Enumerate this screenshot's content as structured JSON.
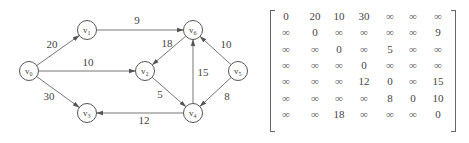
{
  "graph": {
    "nodes": [
      {
        "id": "v0",
        "base": "v",
        "sub": "0",
        "x": 29,
        "y": 71
      },
      {
        "id": "v1",
        "base": "v",
        "sub": "1",
        "x": 87,
        "y": 30
      },
      {
        "id": "v2",
        "base": "v",
        "sub": "2",
        "x": 145,
        "y": 71
      },
      {
        "id": "v3",
        "base": "v",
        "sub": "3",
        "x": 87,
        "y": 113
      },
      {
        "id": "v4",
        "base": "v",
        "sub": "4",
        "x": 193,
        "y": 113
      },
      {
        "id": "v5",
        "base": "v",
        "sub": "5",
        "x": 238,
        "y": 71
      },
      {
        "id": "v6",
        "base": "v",
        "sub": "6",
        "x": 193,
        "y": 30
      }
    ],
    "edges": [
      {
        "from": "v0",
        "to": "v1",
        "weight": "20",
        "lx": 52,
        "ly": 48
      },
      {
        "from": "v0",
        "to": "v2",
        "weight": "10",
        "lx": 88,
        "ly": 66
      },
      {
        "from": "v0",
        "to": "v3",
        "weight": "30",
        "lx": 49,
        "ly": 100
      },
      {
        "from": "v1",
        "to": "v6",
        "weight": "9",
        "lx": 137,
        "ly": 24
      },
      {
        "from": "v6",
        "to": "v2",
        "weight": "18",
        "lx": 167,
        "ly": 47
      },
      {
        "from": "v2",
        "to": "v4",
        "weight": "5",
        "lx": 160,
        "ly": 98
      },
      {
        "from": "v4",
        "to": "v6",
        "weight": "15",
        "lx": 203,
        "ly": 76
      },
      {
        "from": "v4",
        "to": "v3",
        "weight": "12",
        "lx": 144,
        "ly": 124
      },
      {
        "from": "v5",
        "to": "v6",
        "weight": "10",
        "lx": 226,
        "ly": 48
      },
      {
        "from": "v5",
        "to": "v4",
        "weight": "8",
        "lx": 227,
        "ly": 100
      }
    ]
  },
  "matrix": {
    "rows": [
      [
        "0",
        "20",
        "10",
        "30",
        "∞",
        "∞",
        "∞"
      ],
      [
        "∞",
        "0",
        "∞",
        "∞",
        "∞",
        "∞",
        "9"
      ],
      [
        "∞",
        "∞",
        "0",
        "∞",
        "5",
        "∞",
        "∞"
      ],
      [
        "∞",
        "∞",
        "∞",
        "0",
        "∞",
        "∞",
        "∞"
      ],
      [
        "∞",
        "∞",
        "∞",
        "12",
        "0",
        "∞",
        "15"
      ],
      [
        "∞",
        "∞",
        "∞",
        "∞",
        "8",
        "0",
        "10"
      ],
      [
        "∞",
        "∞",
        "18",
        "∞",
        "∞",
        "∞",
        "0"
      ]
    ]
  },
  "colors": {
    "stroke": "#555555",
    "text": "#444444",
    "background": "#ffffff"
  }
}
